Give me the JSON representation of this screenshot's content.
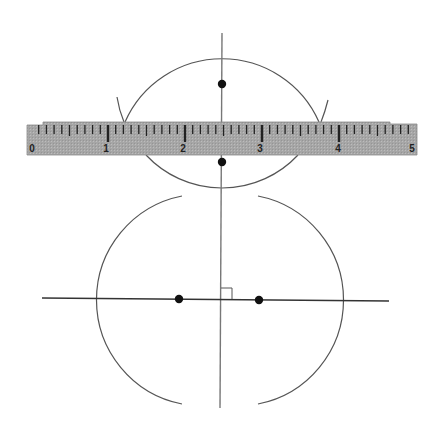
{
  "diagram": {
    "type": "geometric-construction",
    "colors": {
      "background": "#ffffff",
      "line": "#444444",
      "arc": "#555555",
      "point": "#111111",
      "ruler_fill": "#a9a9a9",
      "ruler_tick": "#222222"
    },
    "ruler": {
      "labels": [
        "0",
        "1",
        "2",
        "3",
        "4",
        "5"
      ],
      "x_start": 27,
      "x_end": 417,
      "y_top": 122,
      "y_bottom": 155,
      "unit_px": 77,
      "subdivisions": 10
    },
    "points": [
      {
        "name": "top-point",
        "x": 222,
        "y": 84
      },
      {
        "name": "ruler-bottom-point",
        "x": 222,
        "y": 162
      },
      {
        "name": "left-point",
        "x": 179,
        "y": 299
      },
      {
        "name": "right-point",
        "x": 259,
        "y": 300
      }
    ],
    "lines": [
      {
        "name": "vertical-bisector",
        "x1": 222,
        "y1": 33,
        "x2": 220,
        "y2": 408
      },
      {
        "name": "horizontal-segment-line",
        "x1": 42,
        "y1": 298,
        "x2": 389,
        "y2": 301
      }
    ],
    "right_angle_marker": {
      "x": 221,
      "y": 288,
      "size": 11
    }
  }
}
